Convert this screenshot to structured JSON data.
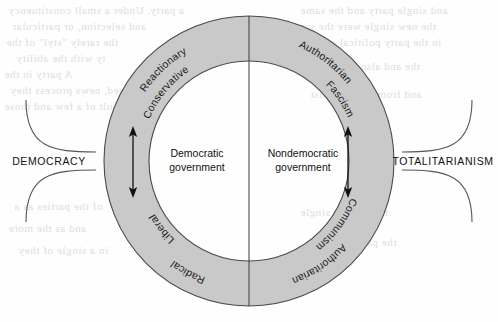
{
  "figure": {
    "type": "circular-political-spectrum-diagram",
    "background_color": "#fefefe",
    "ring_fill_color": "#c9c9c9",
    "ring_stroke_color": "#4a4a4a",
    "text_color": "#111111"
  },
  "center": {
    "left_label_line1": "Democratic",
    "left_label_line2": "government",
    "right_label_line1": "Nondemocratic",
    "right_label_line2": "government"
  },
  "ring_labels": {
    "upper_left_outer": "Reactionary",
    "upper_left_inner": "Conservative",
    "lower_left_inner": "Liberal",
    "lower_left_outer": "Radical",
    "upper_right_outer": "Authoritarian",
    "upper_right_inner": "Fascism",
    "lower_right_inner": "Communism",
    "lower_right_outer": "Authoritarian"
  },
  "side_labels": {
    "left": "DEMOCRACY",
    "right": "TOTALITARIANISM"
  },
  "arrows": {
    "left_arrow_name": "double-headed-arrow-left",
    "right_arrow_name": "double-headed-arrow-right"
  },
  "bleed_through_text": [
    "a party. Under a small constituency",
    "and selection, or particular",
    "the rarely \"styl\" of the",
    "ty with the ability",
    "A party in the",
    "the proceed, news process they",
    "result of a few and those",
    "and single party and the same",
    "the new single were the same",
    "in the party political one",
    "the and also to single of",
    "and from the party list",
    "of the parties as a",
    "and as the more",
    "in a single of they",
    "the and the single",
    "the parties of the"
  ]
}
